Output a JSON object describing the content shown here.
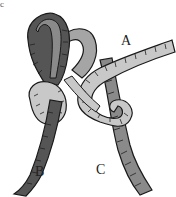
{
  "figure": {
    "corner_mark": "c",
    "labels": {
      "a": "A",
      "b": "B",
      "c": "C"
    },
    "colors": {
      "rope_dark": "#555555",
      "rope_mid": "#8a8a8a",
      "rope_light": "#c8c8c8",
      "outline": "#1a1a1a",
      "background": "#ffffff"
    }
  }
}
